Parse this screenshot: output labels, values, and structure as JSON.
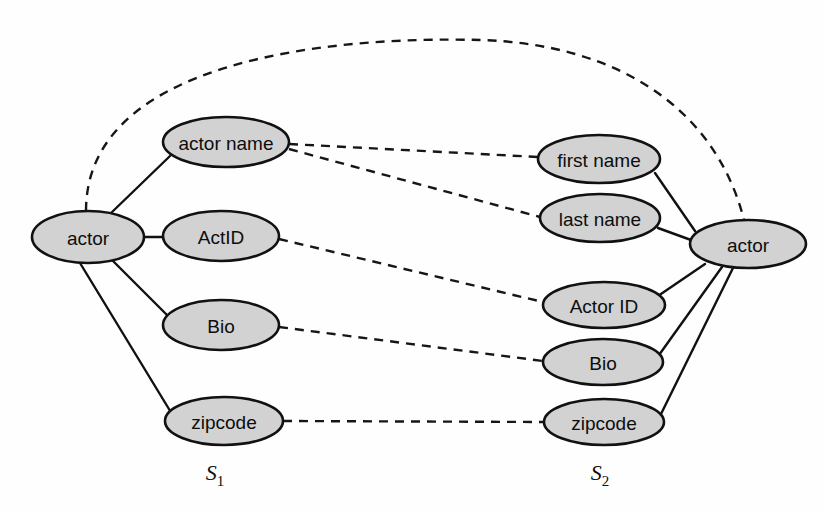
{
  "figure": {
    "background_color": "#fefefe",
    "node_fill_color": "#d2d2d2",
    "node_stroke_color": "#111111",
    "edge_color": "#111111"
  },
  "schemas": [
    {
      "id": "s1",
      "label_base": "S",
      "label_sub": "1",
      "label_x": 215,
      "label_y": 480,
      "root": {
        "id": "s1-actor",
        "label": "actor",
        "cx": 88,
        "cy": 237,
        "rx": 56,
        "ry": 26
      },
      "attributes": [
        {
          "id": "s1-actor-name",
          "label": "actor name",
          "cx": 226,
          "cy": 142,
          "rx": 63,
          "ry": 25
        },
        {
          "id": "s1-actid",
          "label": "ActID",
          "cx": 221,
          "cy": 236,
          "rx": 58,
          "ry": 25
        },
        {
          "id": "s1-bio",
          "label": "Bio",
          "cx": 221,
          "cy": 325,
          "rx": 58,
          "ry": 25
        },
        {
          "id": "s1-zipcode",
          "label": "zipcode",
          "cx": 224,
          "cy": 421,
          "rx": 59,
          "ry": 24
        }
      ]
    },
    {
      "id": "s2",
      "label_base": "S",
      "label_sub": "2",
      "label_x": 600,
      "label_y": 480,
      "root": {
        "id": "s2-actor",
        "label": "actor",
        "cx": 748,
        "cy": 244,
        "rx": 58,
        "ry": 24
      },
      "attributes": [
        {
          "id": "s2-first-name",
          "label": "first name",
          "cx": 599,
          "cy": 159,
          "rx": 61,
          "ry": 24
        },
        {
          "id": "s2-last-name",
          "label": "last name",
          "cx": 600,
          "cy": 218,
          "rx": 60,
          "ry": 24
        },
        {
          "id": "s2-actor-id",
          "label": "Actor ID",
          "cx": 604,
          "cy": 305,
          "rx": 61,
          "ry": 23
        },
        {
          "id": "s2-bio",
          "label": "Bio",
          "cx": 603,
          "cy": 362,
          "rx": 60,
          "ry": 23
        },
        {
          "id": "s2-zipcode",
          "label": "zipcode",
          "cx": 604,
          "cy": 422,
          "rx": 60,
          "ry": 23
        }
      ]
    }
  ],
  "structural_edges": [
    {
      "id": "e-s1-actor-name",
      "from": "s1-actor",
      "to": "s1-actor-name",
      "x1": 110,
      "y1": 214,
      "x2": 170,
      "y2": 156
    },
    {
      "id": "e-s1-actid",
      "from": "s1-actor",
      "to": "s1-actid",
      "x1": 144,
      "y1": 237,
      "x2": 163,
      "y2": 237
    },
    {
      "id": "e-s1-bio",
      "from": "s1-actor",
      "to": "s1-bio",
      "x1": 113,
      "y1": 261,
      "x2": 168,
      "y2": 316
    },
    {
      "id": "e-s1-zipcode",
      "from": "s1-actor",
      "to": "s1-zipcode",
      "x1": 80,
      "y1": 263,
      "x2": 172,
      "y2": 414
    },
    {
      "id": "e-s2-first-name",
      "from": "s2-actor",
      "to": "s2-first-name",
      "x1": 695,
      "y1": 231,
      "x2": 655,
      "y2": 173
    },
    {
      "id": "e-s2-last-name",
      "from": "s2-actor",
      "to": "s2-last-name",
      "x1": 691,
      "y1": 240,
      "x2": 658,
      "y2": 228
    },
    {
      "id": "e-s2-actor-id",
      "from": "s2-actor",
      "to": "s2-actor-id",
      "x1": 705,
      "y1": 264,
      "x2": 658,
      "y2": 296
    },
    {
      "id": "e-s2-bio",
      "from": "s2-actor",
      "to": "s2-bio",
      "x1": 722,
      "y1": 267,
      "x2": 659,
      "y2": 355
    },
    {
      "id": "e-s2-zipcode",
      "from": "s2-actor",
      "to": "s2-zipcode",
      "x1": 733,
      "y1": 268,
      "x2": 660,
      "y2": 416
    }
  ],
  "match_edges": [
    {
      "id": "m-actor-actor",
      "from": "s1-actor",
      "to": "s2-actor",
      "kind": "arc",
      "path": "M 86 211 C 86 60, 330 36, 480 40 C 620 44, 716 110, 744 220"
    },
    {
      "id": "m-actorname-firstname",
      "from": "s1-actor-name",
      "to": "s2-first-name",
      "kind": "line",
      "x1": 289,
      "y1": 144,
      "x2": 538,
      "y2": 157
    },
    {
      "id": "m-actorname-lastname",
      "from": "s1-actor-name",
      "to": "s2-last-name",
      "kind": "line",
      "x1": 289,
      "y1": 149,
      "x2": 540,
      "y2": 217
    },
    {
      "id": "m-actid-actorid",
      "from": "s1-actid",
      "to": "s2-actor-id",
      "kind": "line",
      "x1": 279,
      "y1": 239,
      "x2": 543,
      "y2": 302
    },
    {
      "id": "m-bio-bio",
      "from": "s1-bio",
      "to": "s2-bio",
      "kind": "line",
      "x1": 279,
      "y1": 327,
      "x2": 543,
      "y2": 361
    },
    {
      "id": "m-zipcode-zipcode",
      "from": "s1-zipcode",
      "to": "s2-zipcode",
      "kind": "line",
      "x1": 283,
      "y1": 421,
      "x2": 544,
      "y2": 422
    }
  ]
}
